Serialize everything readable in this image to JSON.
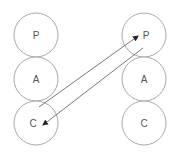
{
  "diagram": {
    "columns": [
      {
        "id": "left",
        "nodes": [
          {
            "label": "P"
          },
          {
            "label": "A"
          },
          {
            "label": "C"
          }
        ]
      },
      {
        "id": "right",
        "nodes": [
          {
            "label": "P"
          },
          {
            "label": "A"
          },
          {
            "label": "C"
          }
        ]
      }
    ],
    "edges": [
      {
        "from": "left.C",
        "to": "right.P",
        "arrow": "end"
      },
      {
        "from": "right.P",
        "to": "left.C",
        "arrow": "end"
      }
    ],
    "colors": {
      "node_stroke": "#a8a8a8",
      "edge": "#555555",
      "text": "#555555"
    }
  }
}
